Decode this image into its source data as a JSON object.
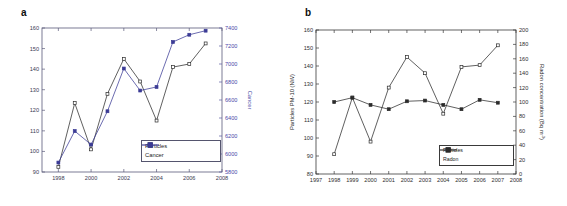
{
  "figure": {
    "panel_a_letter": "a",
    "panel_b_letter": "b"
  },
  "chart_data": [
    {
      "id": "panel-a",
      "type": "line",
      "title": "",
      "xlabel": "",
      "ylabel": "",
      "y2label": "Cancer",
      "x": [
        1998,
        1999,
        2000,
        2001,
        2002,
        2003,
        2004,
        2005,
        2006,
        2007
      ],
      "xlim": [
        1997,
        2008
      ],
      "xticks": [
        1998,
        2000,
        2002,
        2004,
        2006,
        2008
      ],
      "xticklabels": [
        "1998",
        "2000",
        "2002",
        "2004",
        "2006",
        "2008"
      ],
      "ylim": [
        90,
        160
      ],
      "yticks": [
        90,
        100,
        110,
        120,
        130,
        140,
        150,
        160
      ],
      "yticklabels": [
        "90",
        "100",
        "110",
        "120",
        "130",
        "140",
        "150",
        "160"
      ],
      "y2lim": [
        5800,
        7400
      ],
      "y2ticks": [
        5800,
        6000,
        6200,
        6400,
        6600,
        6800,
        7000,
        7200,
        7400
      ],
      "y2ticklabels": [
        "5800",
        "6000",
        "6200",
        "6400",
        "6600",
        "6800",
        "7000",
        "7200",
        "7400"
      ],
      "grid": false,
      "legend_position": "lower-right",
      "series": [
        {
          "name": "Particles",
          "axis": "left",
          "marker": "open-square",
          "color": "#2b2b2b",
          "values": [
            92.5,
            123.5,
            101,
            128,
            145,
            134,
            115,
            141,
            142.5,
            152.5
          ]
        },
        {
          "name": "Cancer",
          "axis": "right",
          "marker": "filled-square",
          "color": "#3b3b95",
          "values": [
            5905,
            6255,
            6105,
            6475,
            6950,
            6705,
            6745,
            7245,
            7325,
            7370
          ]
        }
      ]
    },
    {
      "id": "panel-b",
      "type": "line",
      "title": "",
      "xlabel": "",
      "ylabel": "Particles PM-10 (NW)",
      "y2label_main": "Radon concentration (Bq m",
      "y2label_sup": "-3",
      "y2label_tail": ")",
      "x": [
        1998,
        1999,
        2000,
        2001,
        2002,
        2003,
        2004,
        2005,
        2006,
        2007
      ],
      "xlim": [
        1997,
        2008
      ],
      "xticks": [
        1997,
        1998,
        1999,
        2000,
        2001,
        2002,
        2003,
        2004,
        2005,
        2006,
        2007,
        2008
      ],
      "xticklabels": [
        "1997",
        "1998",
        "1999",
        "2000",
        "2001",
        "2002",
        "2003",
        "2004",
        "2005",
        "2006",
        "2007",
        "2008"
      ],
      "ylim": [
        80,
        160
      ],
      "yticks": [
        80,
        90,
        100,
        110,
        120,
        130,
        140,
        150,
        160
      ],
      "yticklabels": [
        "80",
        "90",
        "100",
        "110",
        "120",
        "130",
        "140",
        "150",
        "160"
      ],
      "y2lim": [
        0,
        200
      ],
      "y2ticks": [
        0,
        20,
        40,
        60,
        80,
        100,
        120,
        140,
        160,
        180,
        200
      ],
      "y2ticklabels": [
        "0",
        "20",
        "40",
        "60",
        "80",
        "100",
        "120",
        "140",
        "160",
        "180",
        "200"
      ],
      "grid": false,
      "legend_position": "lower-right",
      "series": [
        {
          "name": "Particles",
          "axis": "left",
          "marker": "open-square",
          "color": "#2b2b2b",
          "values": [
            91,
            122.5,
            98,
            128,
            145,
            136,
            113.5,
            139.5,
            140.5,
            151.5
          ]
        },
        {
          "name": "Radon",
          "axis": "right",
          "marker": "filled-square",
          "color": "#2b2b2b",
          "values": [
            100,
            106,
            96,
            90,
            101,
            102,
            96,
            90,
            103,
            99
          ]
        }
      ]
    }
  ],
  "colors": {
    "cancer_blue": "#3b3b95",
    "axis_blue": "#4a4aa8",
    "black": "#2b2b2b"
  }
}
